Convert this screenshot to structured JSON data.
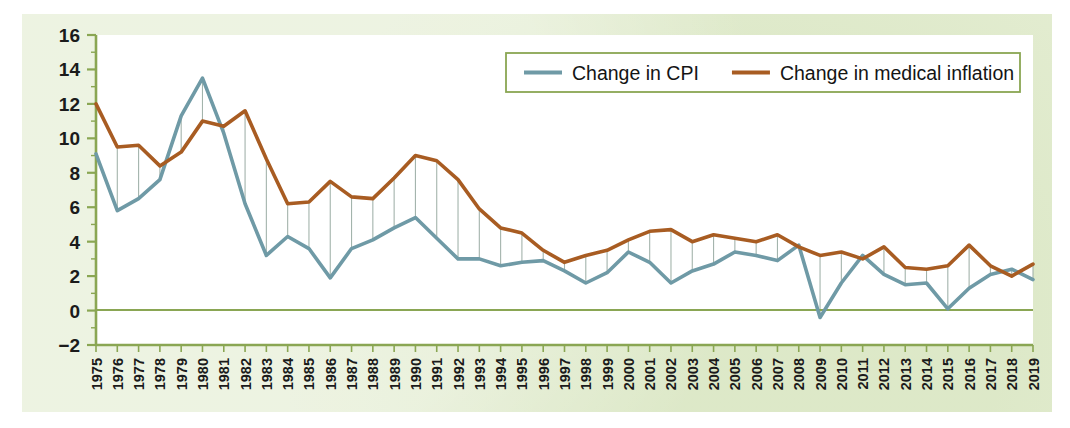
{
  "chart_data": {
    "type": "line",
    "title": "",
    "subtitle": "",
    "xlabel": "",
    "ylabel": "",
    "xlim": [
      1975,
      2019
    ],
    "ylim": [
      -2,
      16
    ],
    "ytick_step": 2,
    "grid": false,
    "zero_line": true,
    "dropline_connectors": true,
    "legend_position": "top-right",
    "categories": [
      "1975",
      "1976",
      "1977",
      "1978",
      "1979",
      "1980",
      "1981",
      "1982",
      "1983",
      "1984",
      "1985",
      "1986",
      "1987",
      "1988",
      "1989",
      "1990",
      "1991",
      "1992",
      "1993",
      "1994",
      "1995",
      "1996",
      "1997",
      "1998",
      "1999",
      "2000",
      "2001",
      "2002",
      "2003",
      "2004",
      "2005",
      "2006",
      "2007",
      "2008",
      "2009",
      "2010",
      "2011",
      "2012",
      "2013",
      "2014",
      "2015",
      "2016",
      "2017",
      "2018",
      "2019"
    ],
    "yticks": [
      -2,
      0,
      2,
      4,
      6,
      8,
      10,
      12,
      14,
      16
    ],
    "series": [
      {
        "name": "Change in CPI",
        "color": "#6f9aa6",
        "values": [
          9.1,
          5.8,
          6.5,
          7.6,
          11.3,
          13.5,
          10.3,
          6.2,
          3.2,
          4.3,
          3.6,
          1.9,
          3.6,
          4.1,
          4.8,
          5.4,
          4.2,
          3.0,
          3.0,
          2.6,
          2.8,
          2.9,
          2.3,
          1.6,
          2.2,
          3.4,
          2.8,
          1.6,
          2.3,
          2.7,
          3.4,
          3.2,
          2.9,
          3.8,
          -0.4,
          1.6,
          3.2,
          2.1,
          1.5,
          1.6,
          0.1,
          1.3,
          2.1,
          2.4,
          1.8
        ]
      },
      {
        "name": "Change in medical inflation",
        "color": "#a85c22",
        "values": [
          12.0,
          9.5,
          9.6,
          8.4,
          9.2,
          11.0,
          10.7,
          11.6,
          8.8,
          6.2,
          6.3,
          7.5,
          6.6,
          6.5,
          7.7,
          9.0,
          8.7,
          7.6,
          5.9,
          4.8,
          4.5,
          3.5,
          2.8,
          3.2,
          3.5,
          4.1,
          4.6,
          4.7,
          4.0,
          4.4,
          4.2,
          4.0,
          4.4,
          3.7,
          3.2,
          3.4,
          3.0,
          3.7,
          2.5,
          2.4,
          2.6,
          3.8,
          2.6,
          2.0,
          2.7
        ]
      }
    ],
    "legend": [
      {
        "label": "Change in CPI",
        "color": "#6f9aa6"
      },
      {
        "label": "Change in medical inflation",
        "color": "#a85c22"
      }
    ]
  },
  "style": {
    "panel_background": "#e4edd2",
    "plot_background": "#ffffff",
    "axis_color": "#8aa653",
    "zero_line_color": "#8aa653",
    "connector_color": "#9fb0a8",
    "legend_border": "#8aa653",
    "tick_label_color": "#1b1b1b"
  }
}
